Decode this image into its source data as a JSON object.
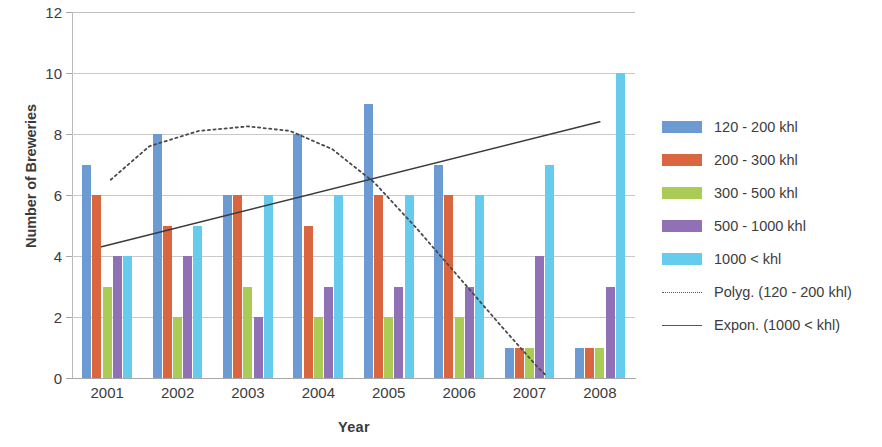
{
  "chart_data": {
    "type": "bar",
    "title": "",
    "xlabel": "Year",
    "ylabel": "Number of Breweries",
    "categories": [
      "2001",
      "2002",
      "2003",
      "2004",
      "2005",
      "2006",
      "2007",
      "2008"
    ],
    "ylim": [
      0,
      12
    ],
    "yticks": [
      0,
      2,
      4,
      6,
      8,
      10,
      12
    ],
    "grid": true,
    "legend_position": "right",
    "series": [
      {
        "name": "120 - 200 khl",
        "color": "#6b9bd2",
        "values": [
          7,
          8,
          6,
          8,
          9,
          7,
          1,
          1
        ]
      },
      {
        "name": "200 - 300 khl",
        "color": "#d9663f",
        "values": [
          6,
          5,
          6,
          5,
          6,
          6,
          1,
          1
        ]
      },
      {
        "name": "300 - 500 khl",
        "color": "#aacc54",
        "values": [
          3,
          2,
          3,
          2,
          2,
          2,
          1,
          1
        ]
      },
      {
        "name": "500 - 1000 khl",
        "color": "#9071b5",
        "values": [
          4,
          4,
          2,
          3,
          3,
          3,
          4,
          3
        ]
      },
      {
        "name": "1000 < khl",
        "color": "#66ccee",
        "values": [
          4,
          5,
          6,
          6,
          6,
          6,
          7,
          10
        ]
      }
    ],
    "trendlines": [
      {
        "name": "Polyg. (120 - 200 khl)",
        "style": "dotted",
        "color": "#4a4a4a",
        "points": [
          [
            0.05,
            6.5
          ],
          [
            0.6,
            7.6
          ],
          [
            1.3,
            8.1
          ],
          [
            2.0,
            8.25
          ],
          [
            2.6,
            8.1
          ],
          [
            3.2,
            7.5
          ],
          [
            3.8,
            6.4
          ],
          [
            4.4,
            4.9
          ],
          [
            5.0,
            3.3
          ],
          [
            5.6,
            1.7
          ],
          [
            6.1,
            0.4
          ],
          [
            6.25,
            0.05
          ]
        ]
      },
      {
        "name": "Expon. (1000 < khl)",
        "style": "solid",
        "color": "#3a3a3a",
        "points": [
          [
            -0.08,
            4.3
          ],
          [
            7.0,
            8.4
          ]
        ]
      }
    ]
  },
  "legend": {
    "items": [
      {
        "label": "120 - 200 khl",
        "kind": "swatch",
        "color": "#6b9bd2"
      },
      {
        "label": "200 - 300 khl",
        "kind": "swatch",
        "color": "#d9663f"
      },
      {
        "label": "300 - 500 khl",
        "kind": "swatch",
        "color": "#aacc54"
      },
      {
        "label": "500 - 1000 khl",
        "kind": "swatch",
        "color": "#9071b5"
      },
      {
        "label": "1000 < khl",
        "kind": "swatch",
        "color": "#66ccee"
      },
      {
        "label": "Polyg. (120 - 200 khl)",
        "kind": "dotted",
        "color": "#595959"
      },
      {
        "label": "Expon. (1000 < khl)",
        "kind": "solid",
        "color": "#595959"
      }
    ]
  }
}
